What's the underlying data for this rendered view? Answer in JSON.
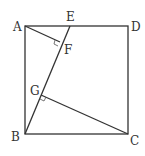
{
  "diagram": {
    "type": "geometry",
    "points": {
      "A": {
        "label": "A",
        "x": 25,
        "y": 26
      },
      "D": {
        "label": "D",
        "x": 128,
        "y": 26
      },
      "B": {
        "label": "B",
        "x": 25,
        "y": 134
      },
      "C": {
        "label": "C",
        "x": 128,
        "y": 134
      },
      "E": {
        "label": "E",
        "x": 70,
        "y": 26
      },
      "F": {
        "label": "F",
        "x": 60,
        "y": 44
      },
      "G": {
        "label": "G",
        "x": 41,
        "y": 94
      }
    },
    "segments": [
      "AD",
      "DC",
      "CB",
      "BA",
      "BE",
      "AF",
      "CG"
    ],
    "right_angles": [
      "F",
      "G"
    ],
    "colors": {
      "stroke": "#333333",
      "background": "#ffffff"
    }
  }
}
